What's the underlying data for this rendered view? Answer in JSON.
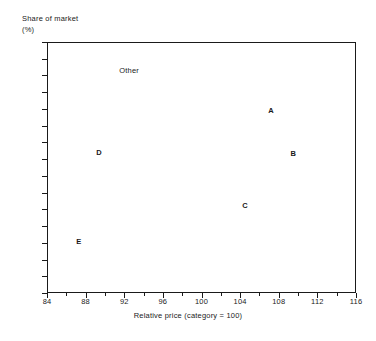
{
  "chart_data": {
    "type": "scatter",
    "title": "",
    "xlabel": "Relative price (category = 100)",
    "ylabel": "Share of market",
    "ylabel_unit": "(%)",
    "xlim": [
      84,
      116
    ],
    "ylim": [
      0,
      30
    ],
    "xticks": [
      84,
      88,
      92,
      96,
      100,
      104,
      108,
      112,
      116
    ],
    "xtick_labels": [
      "84",
      "88",
      "92",
      "96",
      "100",
      "104",
      "108",
      "112",
      "116"
    ],
    "x_minor_ticks": [
      86,
      90,
      94,
      98,
      102,
      106,
      110,
      114
    ],
    "yticks": [
      0,
      2,
      4,
      6,
      8,
      10,
      12,
      14,
      16,
      18,
      20,
      22,
      24,
      26,
      28,
      30
    ],
    "ytick_labels": [
      "0",
      "2",
      "4",
      "6",
      "8",
      "10",
      "12",
      "14",
      "16",
      "18",
      "20",
      "22",
      "24",
      "26",
      "28",
      "30"
    ],
    "grid": false,
    "legend": "none",
    "marker_style": "text-label",
    "points": [
      {
        "label": "Other",
        "x": 92.5,
        "y": 26.7,
        "bold": false
      },
      {
        "label": "A",
        "x": 107.2,
        "y": 21.9,
        "bold": true
      },
      {
        "label": "B",
        "x": 109.5,
        "y": 16.7,
        "bold": true
      },
      {
        "label": "C",
        "x": 104.5,
        "y": 10.5,
        "bold": true
      },
      {
        "label": "D",
        "x": 89.4,
        "y": 16.9,
        "bold": true
      },
      {
        "label": "E",
        "x": 87.3,
        "y": 6.2,
        "bold": true
      }
    ]
  },
  "colors": {
    "background": "#ffffff",
    "axis": "#1a1a1a",
    "text": "#1a1a1a"
  }
}
